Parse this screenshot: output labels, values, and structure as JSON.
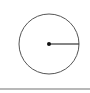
{
  "diagram": {
    "shape": "circle-with-radius",
    "circle": {
      "cx": 49,
      "cy": 44,
      "r": 30,
      "stroke_color": "#555555"
    },
    "center_point": {
      "cx": 49,
      "cy": 44,
      "r": 2,
      "fill_color": "#111111"
    },
    "radius_line": {
      "x1": 49,
      "y1": 44,
      "x2": 79,
      "y2": 44,
      "stroke_color": "#333333"
    },
    "divider_color": "#b8b8b8"
  }
}
